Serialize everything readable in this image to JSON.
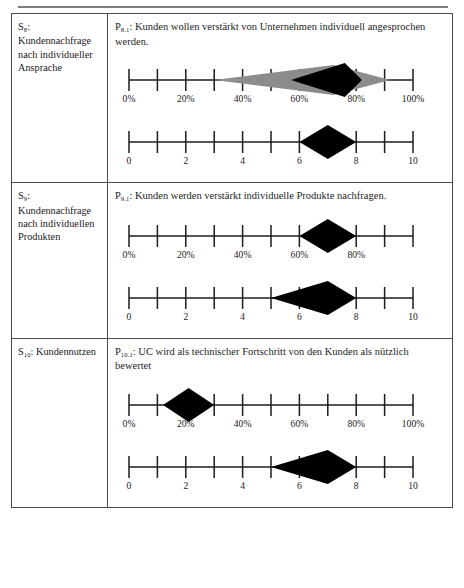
{
  "document": {
    "top_rule": true,
    "rows": [
      {
        "construct_id": "S",
        "construct_sub": "8",
        "construct_label": "Kundennachfrage nach individueller Ansprache",
        "proposition_id": "P",
        "proposition_sub": "8.1",
        "proposition_text": "Kunden wollen verstärkt von Unternehmen individuell angesprochen werden.",
        "charts": [
          {
            "type": "range",
            "scale": "percent",
            "axis_min": 0,
            "axis_max": 100,
            "tick_step": 10,
            "tick_labels": [
              "0%",
              "20%",
              "40%",
              "60%",
              "80%",
              "100%"
            ],
            "labeled_ticks": [
              0,
              20,
              40,
              60,
              80,
              100
            ],
            "outer_range": [
              30,
              92
            ],
            "outer_peak": 72,
            "inner_range": [
              57,
              82
            ],
            "inner_peak": 76,
            "outer_color": "#8c8c8c",
            "inner_color": "#000000"
          },
          {
            "type": "range",
            "scale": "index",
            "axis_min": 0,
            "axis_max": 10,
            "tick_step": 1,
            "tick_labels": [
              "0",
              "2",
              "4",
              "6",
              "8",
              "10"
            ],
            "labeled_ticks": [
              0,
              2,
              4,
              6,
              8,
              10
            ],
            "inner_range": [
              6,
              8
            ],
            "inner_peak": 7,
            "inner_color": "#000000"
          }
        ]
      },
      {
        "construct_id": "S",
        "construct_sub": "9",
        "construct_label": "Kundennachfrage nach individuellen Produkten",
        "proposition_id": "P",
        "proposition_sub": "9.1",
        "proposition_text": "Kunden werden verstärkt individuelle Produkte nachfragen.",
        "charts": [
          {
            "type": "range",
            "scale": "percent",
            "axis_min": 0,
            "axis_max": 100,
            "tick_step": 10,
            "tick_labels": [
              "0%",
              "20%",
              "40%",
              "60%",
              "80%"
            ],
            "labeled_ticks": [
              0,
              20,
              40,
              60,
              80
            ],
            "inner_range": [
              60,
              80
            ],
            "inner_peak": 70,
            "inner_color": "#000000"
          },
          {
            "type": "range",
            "scale": "index",
            "axis_min": 0,
            "axis_max": 10,
            "tick_step": 1,
            "tick_labels": [
              "0",
              "2",
              "4",
              "6",
              "8",
              "10"
            ],
            "labeled_ticks": [
              0,
              2,
              4,
              6,
              8,
              10
            ],
            "inner_range": [
              5,
              8
            ],
            "inner_peak": 7,
            "inner_color": "#000000"
          }
        ]
      },
      {
        "construct_id": "S",
        "construct_sub": "10",
        "construct_label": "Kundennutzen",
        "proposition_id": "P",
        "proposition_sub": "10.1",
        "proposition_text": "UC wird als technischer Fortschritt von den Kunden als nützlich bewertet",
        "charts": [
          {
            "type": "range",
            "scale": "percent",
            "axis_min": 0,
            "axis_max": 100,
            "tick_step": 10,
            "tick_labels": [
              "0%",
              "20%",
              "40%",
              "60%",
              "80%",
              "100%"
            ],
            "labeled_ticks": [
              0,
              20,
              40,
              60,
              80,
              100
            ],
            "inner_range": [
              12,
              30
            ],
            "inner_peak": 21,
            "inner_color": "#000000"
          },
          {
            "type": "range",
            "scale": "index",
            "axis_min": 0,
            "axis_max": 10,
            "tick_step": 1,
            "tick_labels": [
              "0",
              "2",
              "4",
              "6",
              "8",
              "10"
            ],
            "labeled_ticks": [
              0,
              2,
              4,
              6,
              8,
              10
            ],
            "inner_range": [
              5,
              8
            ],
            "inner_peak": 7,
            "inner_color": "#000000"
          }
        ]
      }
    ]
  }
}
